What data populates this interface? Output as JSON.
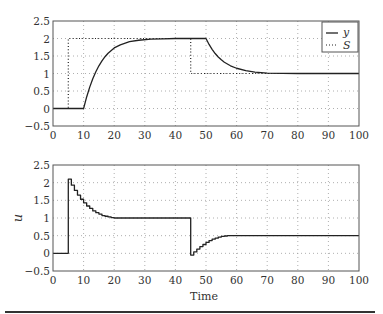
{
  "chart_data": [
    {
      "type": "line",
      "title": "",
      "xlabel": "",
      "ylabel": "",
      "xlim": [
        0,
        100
      ],
      "ylim": [
        -0.5,
        2.5
      ],
      "xticks": [
        0,
        10,
        20,
        30,
        40,
        50,
        60,
        70,
        80,
        90,
        100
      ],
      "yticks": [
        -0.5,
        0,
        0.5,
        1,
        1.5,
        2,
        2.5
      ],
      "ytick_labels": [
        "−0.5",
        "0",
        "0.5",
        "1",
        "1.5",
        "2",
        "2.5"
      ],
      "grid": true,
      "legend": {
        "position": "upper right",
        "entries": [
          "y",
          "S"
        ]
      },
      "series": [
        {
          "name": "y",
          "style": "solid",
          "x": [
            0,
            10,
            11,
            12,
            13,
            14,
            15,
            16,
            17,
            18,
            20,
            22,
            25,
            28,
            32,
            36,
            40,
            45,
            50,
            51,
            52,
            53,
            54,
            55,
            56,
            58,
            60,
            63,
            66,
            70,
            80,
            100
          ],
          "values": [
            0,
            0,
            0.33,
            0.61,
            0.85,
            1.05,
            1.22,
            1.36,
            1.48,
            1.58,
            1.73,
            1.82,
            1.91,
            1.95,
            1.98,
            1.99,
            2.0,
            2.0,
            2.0,
            1.83,
            1.69,
            1.57,
            1.47,
            1.39,
            1.32,
            1.22,
            1.15,
            1.08,
            1.04,
            1.01,
            1.0,
            1.0
          ]
        },
        {
          "name": "S",
          "style": "dotted",
          "x": [
            0,
            5,
            5,
            45,
            45,
            100
          ],
          "values": [
            0,
            0,
            2,
            2,
            1,
            1
          ]
        }
      ]
    },
    {
      "type": "line",
      "title": "",
      "xlabel": "Time",
      "ylabel": "u",
      "xlim": [
        0,
        100
      ],
      "ylim": [
        -0.5,
        2.5
      ],
      "xticks": [
        0,
        10,
        20,
        30,
        40,
        50,
        60,
        70,
        80,
        90,
        100
      ],
      "yticks": [
        -0.5,
        0,
        0.5,
        1,
        1.5,
        2,
        2.5
      ],
      "ytick_labels": [
        "−0.5",
        "0",
        "0.5",
        "1",
        "1.5",
        "2",
        "2.5"
      ],
      "grid": true,
      "series": [
        {
          "name": "u",
          "style": "step",
          "x": [
            0,
            5,
            6,
            7,
            8,
            9,
            10,
            11,
            12,
            13,
            14,
            15,
            16,
            17,
            18,
            19,
            20,
            45,
            46,
            47,
            48,
            49,
            50,
            51,
            52,
            53,
            54,
            55,
            56,
            57,
            58,
            100
          ],
          "values": [
            0,
            2.1,
            1.93,
            1.78,
            1.65,
            1.53,
            1.43,
            1.34,
            1.27,
            1.2,
            1.15,
            1.11,
            1.07,
            1.05,
            1.03,
            1.01,
            1.0,
            -0.05,
            0.04,
            0.12,
            0.19,
            0.25,
            0.31,
            0.36,
            0.4,
            0.43,
            0.46,
            0.48,
            0.49,
            0.5,
            0.5,
            0.5
          ]
        }
      ]
    }
  ],
  "labels": {
    "legend_y": "y",
    "legend_s": "S",
    "xlabel_bottom": "Time",
    "ylabel_bottom": "u"
  }
}
